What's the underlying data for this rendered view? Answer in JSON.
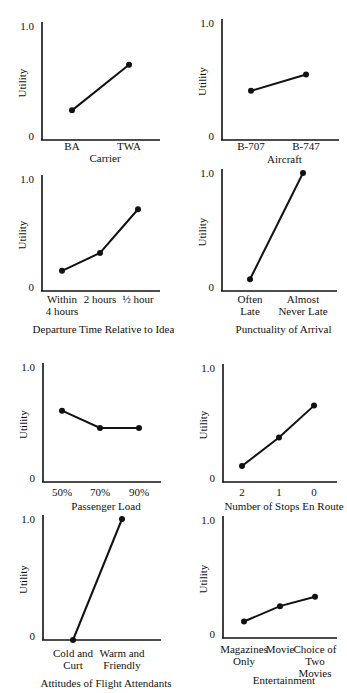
{
  "chart_data": [
    {
      "type": "line",
      "title": "",
      "xlabel": "Carrier",
      "ylabel": "Utility",
      "ylim": [
        0,
        1.0
      ],
      "yticks": [
        "0",
        "1.0"
      ],
      "categories": [
        [
          "BA"
        ],
        [
          "TWA"
        ]
      ],
      "values": [
        0.26,
        0.66
      ],
      "grid": false
    },
    {
      "type": "line",
      "title": "",
      "xlabel": "Aircraft",
      "ylabel": "Utility",
      "ylim": [
        0,
        1.0
      ],
      "yticks": [
        "0",
        "1.0"
      ],
      "categories": [
        [
          "B-707"
        ],
        [
          "B-747"
        ]
      ],
      "values": [
        0.42,
        0.56
      ],
      "grid": false
    },
    {
      "type": "line",
      "title": "",
      "xlabel": "Departure Time Relative to Ideal",
      "ylabel": "Utility",
      "ylim": [
        0,
        1.0
      ],
      "yticks": [
        "0",
        "1.0"
      ],
      "categories": [
        [
          "Within",
          "4 hours"
        ],
        [
          "2 hours"
        ],
        [
          "½ hour"
        ]
      ],
      "values": [
        0.18,
        0.34,
        0.73
      ],
      "grid": false
    },
    {
      "type": "line",
      "title": "",
      "xlabel": "Punctuality of Arrival",
      "ylabel": "Utility",
      "ylim": [
        0,
        1.0
      ],
      "yticks": [
        "0",
        "1.0"
      ],
      "categories": [
        [
          "Often",
          "Late"
        ],
        [
          "Almost",
          "Never Late"
        ]
      ],
      "values": [
        0.1,
        1.0
      ],
      "grid": false
    },
    {
      "type": "line",
      "title": "",
      "xlabel": "Passenger Load",
      "ylabel": "Utility",
      "ylim": [
        0,
        1.0
      ],
      "yticks": [
        "0",
        "1.0"
      ],
      "categories": [
        [
          "50%"
        ],
        [
          "70%"
        ],
        [
          "90%"
        ]
      ],
      "values": [
        0.62,
        0.47,
        0.47
      ],
      "grid": false
    },
    {
      "type": "line",
      "title": "",
      "xlabel": "Number of Stops En Route",
      "ylabel": "Utility",
      "ylim": [
        0,
        1.0
      ],
      "yticks": [
        "0",
        "1.0"
      ],
      "categories": [
        [
          "2"
        ],
        [
          "1"
        ],
        [
          "0"
        ]
      ],
      "values": [
        0.14,
        0.39,
        0.67
      ],
      "grid": false
    },
    {
      "type": "line",
      "title": "",
      "xlabel": "Attitudes of Flight Attendants",
      "ylabel": "Utility",
      "ylim": [
        0,
        1.0
      ],
      "yticks": [
        "0",
        "1.0"
      ],
      "categories": [
        [
          "Cold and",
          "Curt"
        ],
        [
          "Warm and",
          "Friendly"
        ]
      ],
      "values": [
        0.0,
        1.0
      ],
      "grid": false
    },
    {
      "type": "line",
      "title": "",
      "xlabel": "Entertainment",
      "ylabel": "Utility",
      "ylim": [
        0,
        1.0
      ],
      "yticks": [
        "0",
        "1.0"
      ],
      "categories": [
        [
          "Magazines",
          "Only"
        ],
        [
          "Movie"
        ],
        [
          "Choice of",
          "Two",
          "Movies"
        ]
      ],
      "values": [
        0.14,
        0.27,
        0.35
      ],
      "grid": false
    }
  ],
  "layout": {
    "panels": [
      {
        "x": 0,
        "y": 0,
        "axisX": 42,
        "yTop": 26,
        "yZero": 140,
        "axisRight": 160,
        "px": [
          72,
          129
        ],
        "tickLabelY": 150,
        "xlabelY": 162
      },
      {
        "x": 174,
        "y": 0,
        "axisX": 48,
        "yTop": 23,
        "yZero": 140,
        "axisRight": 165,
        "px": [
          77,
          132
        ],
        "tickLabelY": 150,
        "xlabelY": 163
      },
      {
        "x": 0,
        "y": 165,
        "axisX": 42,
        "yTop": 14,
        "yZero": 126,
        "axisRight": 160,
        "px": [
          62,
          100,
          138
        ],
        "tickLabelY": 138,
        "xlabelY": 168
      },
      {
        "x": 174,
        "y": 165,
        "axisX": 48,
        "yTop": 8,
        "yZero": 126,
        "axisRight": 163,
        "px": [
          76,
          129
        ],
        "tickLabelY": 138,
        "xlabelY": 168
      },
      {
        "x": 0,
        "y": 355,
        "axisX": 43,
        "yTop": 12,
        "yZero": 127,
        "axisRight": 161,
        "px": [
          62,
          100,
          139
        ],
        "tickLabelY": 141,
        "xlabelY": 155
      },
      {
        "x": 174,
        "y": 355,
        "axisX": 49,
        "yTop": 13,
        "yZero": 127,
        "axisRight": 163,
        "px": [
          68,
          105,
          140
        ],
        "tickLabelY": 141,
        "xlabelY": 155
      },
      {
        "x": 0,
        "y": 505,
        "axisX": 43,
        "yTop": 14,
        "yZero": 135,
        "axisRight": 161,
        "px": [
          73,
          122
        ],
        "tickLabelY": 152,
        "xlabelY": 182
      },
      {
        "x": 174,
        "y": 505,
        "axisX": 49,
        "yTop": 15,
        "yZero": 133,
        "axisRight": 163,
        "px": [
          70,
          106,
          141
        ],
        "tickLabelY": 148,
        "xlabelY": 179
      }
    ]
  }
}
